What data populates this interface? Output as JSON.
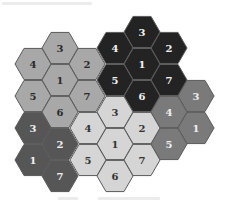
{
  "diagram": {
    "type": "hexagonal-cluster-layout",
    "hex_orientation": "flat-top",
    "hex_radius": 18,
    "border_color": "#5a5a5a",
    "clusters": [
      {
        "name": "cluster-top-left",
        "fill": "#a8a8a8",
        "text_color": "#2a2a2a",
        "cells": [
          {
            "label": "3",
            "cx": 60,
            "cy": 48
          },
          {
            "label": "4",
            "cx": 33,
            "cy": 64
          },
          {
            "label": "2",
            "cx": 87,
            "cy": 64
          },
          {
            "label": "1",
            "cx": 60,
            "cy": 80
          },
          {
            "label": "5",
            "cx": 33,
            "cy": 96
          },
          {
            "label": "7",
            "cx": 87,
            "cy": 96
          },
          {
            "label": "6",
            "cx": 60,
            "cy": 112
          }
        ]
      },
      {
        "name": "cluster-top-right",
        "fill": "#232323",
        "text_color": "#f2f2f2",
        "cells": [
          {
            "label": "3",
            "cx": 142,
            "cy": 32
          },
          {
            "label": "4",
            "cx": 115,
            "cy": 48
          },
          {
            "label": "2",
            "cx": 169,
            "cy": 48
          },
          {
            "label": "1",
            "cx": 142,
            "cy": 64
          },
          {
            "label": "5",
            "cx": 115,
            "cy": 80
          },
          {
            "label": "7",
            "cx": 169,
            "cy": 80
          },
          {
            "label": "6",
            "cx": 142,
            "cy": 96
          }
        ]
      },
      {
        "name": "cluster-right",
        "fill": "#7a7a7a",
        "text_color": "#eeeeee",
        "cells": [
          {
            "label": "3",
            "cx": 196,
            "cy": 96
          },
          {
            "label": "4",
            "cx": 169,
            "cy": 112
          },
          {
            "label": "1",
            "cx": 196,
            "cy": 128
          },
          {
            "label": "5",
            "cx": 169,
            "cy": 144
          }
        ]
      },
      {
        "name": "cluster-center",
        "fill": "#d5d5d5",
        "text_color": "#333333",
        "cells": [
          {
            "label": "3",
            "cx": 115,
            "cy": 112
          },
          {
            "label": "4",
            "cx": 88,
            "cy": 128
          },
          {
            "label": "2",
            "cx": 142,
            "cy": 128
          },
          {
            "label": "1",
            "cx": 115,
            "cy": 144
          },
          {
            "label": "5",
            "cx": 88,
            "cy": 160
          },
          {
            "label": "7",
            "cx": 142,
            "cy": 160
          },
          {
            "label": "6",
            "cx": 115,
            "cy": 176
          }
        ]
      },
      {
        "name": "cluster-bottom-left",
        "fill": "#565656",
        "text_color": "#f0f0f0",
        "cells": [
          {
            "label": "3",
            "cx": 33,
            "cy": 128
          },
          {
            "label": "2",
            "cx": 60,
            "cy": 144
          },
          {
            "label": "1",
            "cx": 33,
            "cy": 160
          },
          {
            "label": "7",
            "cx": 60,
            "cy": 176
          }
        ]
      }
    ]
  }
}
